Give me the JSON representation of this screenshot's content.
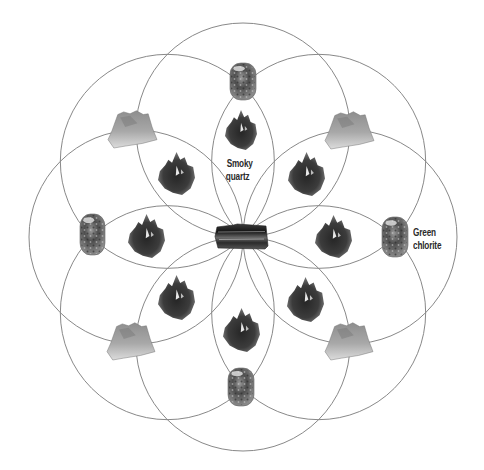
{
  "diagram": {
    "type": "crystal-grid",
    "pattern": "eight overlapping circles (flower pattern)",
    "center": {
      "x": 243,
      "y": 237
    },
    "circle_radius": 107,
    "circle_offset": 107,
    "circle_angles_deg": [
      90,
      135,
      180,
      225,
      270,
      315,
      0,
      45
    ],
    "line_color": "#7a7a7a",
    "background": "#ffffff"
  },
  "labels": {
    "smoky_quartz_line1": "Smoky",
    "smoky_quartz_line2": "quartz",
    "green_chlorite_line1": "Green",
    "green_chlorite_line2": "chlorite"
  },
  "stones": {
    "center": {
      "name": "black tourmaline",
      "x": 215,
      "y": 224,
      "w": 53,
      "h": 25
    },
    "tumbled": [
      {
        "name": "green chlorite",
        "position": "top",
        "x": 230,
        "y": 63,
        "w": 26,
        "h": 37
      },
      {
        "name": "green chlorite",
        "position": "left",
        "x": 80,
        "y": 214,
        "w": 25,
        "h": 41
      },
      {
        "name": "green chlorite",
        "position": "right",
        "x": 382,
        "y": 217,
        "w": 26,
        "h": 40
      },
      {
        "name": "green chlorite",
        "position": "bottom",
        "x": 228,
        "y": 368,
        "w": 26,
        "h": 38
      }
    ],
    "crystals": [
      {
        "name": "smoky quartz",
        "position": "top",
        "x": 225,
        "y": 110,
        "w": 32,
        "h": 40
      },
      {
        "name": "smoky quartz",
        "position": "upper-left",
        "x": 158,
        "y": 152,
        "w": 37,
        "h": 43
      },
      {
        "name": "smoky quartz",
        "position": "upper-right",
        "x": 288,
        "y": 152,
        "w": 37,
        "h": 44
      },
      {
        "name": "smoky quartz",
        "position": "left",
        "x": 128,
        "y": 214,
        "w": 37,
        "h": 44
      },
      {
        "name": "smoky quartz",
        "position": "right",
        "x": 315,
        "y": 215,
        "w": 37,
        "h": 43
      },
      {
        "name": "smoky quartz",
        "position": "lower-left",
        "x": 158,
        "y": 275,
        "w": 37,
        "h": 45
      },
      {
        "name": "smoky quartz",
        "position": "lower-right",
        "x": 287,
        "y": 277,
        "w": 37,
        "h": 45
      },
      {
        "name": "smoky quartz",
        "position": "bottom",
        "x": 223,
        "y": 308,
        "w": 37,
        "h": 44
      }
    ],
    "clusters": [
      {
        "name": "mineral cluster",
        "position": "upper-left",
        "x": 108,
        "y": 110,
        "w": 49,
        "h": 38
      },
      {
        "name": "mineral cluster",
        "position": "upper-right",
        "x": 325,
        "y": 111,
        "w": 49,
        "h": 38
      },
      {
        "name": "mineral cluster",
        "position": "lower-left",
        "x": 107,
        "y": 322,
        "w": 48,
        "h": 38
      },
      {
        "name": "mineral cluster",
        "position": "lower-right",
        "x": 325,
        "y": 322,
        "w": 48,
        "h": 38
      }
    ]
  }
}
